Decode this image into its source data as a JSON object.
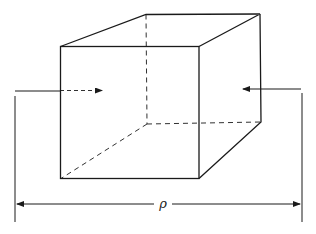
{
  "diagram": {
    "dimension_label": "ρ",
    "colors": {
      "stroke": "#1a1a1a",
      "background": "#ffffff"
    },
    "elements": [
      "front face (solid)",
      "back face (hidden edges dashed)",
      "left arrow entering (dashed inside)",
      "right arrow entering",
      "dimension line with label"
    ]
  }
}
